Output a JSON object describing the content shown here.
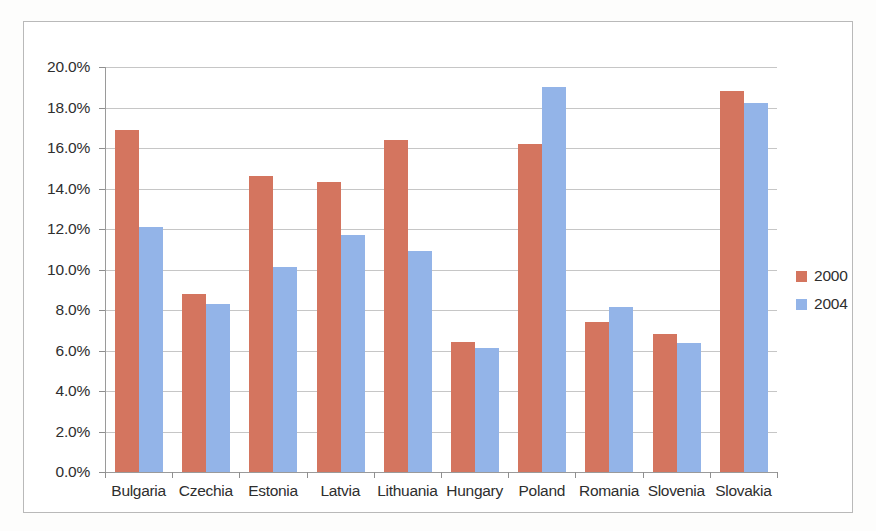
{
  "chart_data": {
    "type": "bar",
    "title": "",
    "subtitle": "",
    "xlabel": "",
    "ylabel": "",
    "ylim": [
      0,
      20
    ],
    "y_tick_labels": [
      "0.0%",
      "2.0%",
      "4.0%",
      "6.0%",
      "8.0%",
      "10.0%",
      "12.0%",
      "14.0%",
      "16.0%",
      "18.0%",
      "20.0%"
    ],
    "y_tick_values": [
      0,
      2,
      4,
      6,
      8,
      10,
      12,
      14,
      16,
      18,
      20
    ],
    "grid": true,
    "legend_position": "right",
    "categories": [
      "Bulgaria",
      "Czechia",
      "Estonia",
      "Latvia",
      "Lithuania",
      "Hungary",
      "Poland",
      "Romania",
      "Slovenia",
      "Slovakia"
    ],
    "series": [
      {
        "name": "2000",
        "color": "#d4755f",
        "values": [
          16.9,
          8.8,
          14.6,
          14.3,
          16.4,
          6.4,
          16.2,
          7.4,
          6.8,
          18.8
        ]
      },
      {
        "name": "2004",
        "color": "#93b4e8",
        "values": [
          12.1,
          8.3,
          10.1,
          11.7,
          10.9,
          6.1,
          19.0,
          8.15,
          6.35,
          18.2
        ]
      }
    ]
  },
  "legend": {
    "entries": [
      {
        "label": "2000",
        "color": "#d4755f"
      },
      {
        "label": "2004",
        "color": "#93b4e8"
      }
    ]
  }
}
